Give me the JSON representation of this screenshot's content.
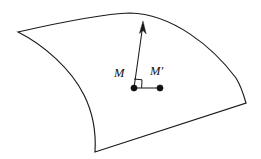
{
  "figure": {
    "background_color": "#ffffff",
    "stroke_color": "#1a1a1a",
    "width": 261,
    "height": 159
  },
  "surface": {
    "name": "curved-surface-patch",
    "description": "Quadrilateral patch with concave left edge and convex top/right edges",
    "corners": {
      "top_left": [
        18,
        32
      ],
      "top_apex": [
        130,
        13
      ],
      "right": [
        246,
        103
      ],
      "bottom_left": [
        95,
        152
      ]
    },
    "path": "M 18 32 C 62 22 101 14 130 13 C 172 14 212 46 236 78 C 241 86 244 96 246 103 L 95 152 C 96 136 95 117 84 95 C 71 69 44 45 18 32 Z"
  },
  "normal_vector": {
    "name": "normal-vector-arrow",
    "from": [
      134,
      88
    ],
    "to": [
      143,
      22
    ],
    "arrow_head_path": "M 143 21 L 139.4 33.5 L 143 30.6 L 146.2 33.9 Z"
  },
  "tangent_segment": {
    "name": "tangent-segment",
    "from": [
      134,
      88
    ],
    "to": [
      160,
      88
    ]
  },
  "right_angle_marker": {
    "name": "right-angle-marker",
    "path": "M 134 79 L 142 79.8 L 141.6 87.8"
  },
  "points": [
    {
      "id": "point-m",
      "label": "M",
      "has_prime": false,
      "dot": {
        "cx": 134,
        "cy": 88,
        "r": 3.1
      },
      "label_pos": {
        "x": 114,
        "y": 77
      }
    },
    {
      "id": "point-m-prime",
      "label": "M",
      "has_prime": true,
      "prime_glyph": "′",
      "dot": {
        "cx": 160,
        "cy": 88,
        "r": 3.1
      },
      "label_pos": {
        "x": 150,
        "y": 75
      }
    }
  ]
}
